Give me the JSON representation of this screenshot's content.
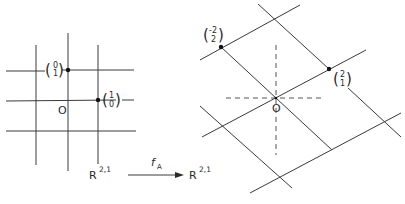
{
  "figure": {
    "left_panel": {
      "name": "domain lattice",
      "space_label": {
        "base": "R",
        "superscript": "2,1"
      },
      "origin_label": "O",
      "basis_vectors": [
        {
          "top": "0",
          "bottom": "1"
        },
        {
          "top": "1",
          "bottom": "0"
        }
      ]
    },
    "map": {
      "label": "f",
      "subscript": "A"
    },
    "right_panel": {
      "name": "image lattice",
      "space_label": {
        "base": "R",
        "superscript": "2,1"
      },
      "origin_label": "O",
      "image_vectors": [
        {
          "top": "-2",
          "bottom": "2"
        },
        {
          "top": "2",
          "bottom": "1"
        }
      ]
    }
  },
  "colors": {
    "line": "#3a3a3a",
    "text": "#2a2a2a",
    "background": "#ffffff"
  }
}
